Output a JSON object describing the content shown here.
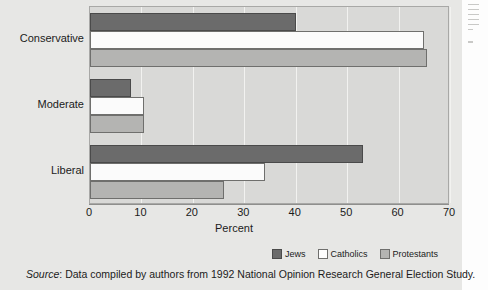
{
  "chart_data": {
    "type": "bar",
    "orientation": "horizontal",
    "title": "",
    "xlabel": "Percent",
    "ylabel": "",
    "xlim": [
      0,
      70
    ],
    "xticks": [
      0,
      10,
      20,
      30,
      40,
      50,
      60,
      70
    ],
    "grid": true,
    "legend_position": "bottom",
    "categories": [
      "Conservative",
      "Moderate",
      "Liberal"
    ],
    "series": [
      {
        "name": "Jews",
        "color": "#6b6b6b",
        "values": [
          40,
          8,
          53
        ]
      },
      {
        "name": "Catholics",
        "color": "#fbfbfb",
        "values": [
          65,
          10.5,
          34
        ]
      },
      {
        "name": "Protestants",
        "color": "#b4b4b2",
        "values": [
          65.5,
          10.5,
          26
        ]
      }
    ]
  },
  "axis": {
    "tick_labels": [
      "0",
      "10",
      "20",
      "30",
      "40",
      "50",
      "60",
      "70"
    ],
    "title": "Percent"
  },
  "legend": {
    "items": [
      {
        "label": "Jews"
      },
      {
        "label": "Catholics"
      },
      {
        "label": "Protestants"
      }
    ]
  },
  "source": {
    "prefix": "Source",
    "separator": ": ",
    "text": "Data compiled by authors from 1992 National Opinion Research General Election Study."
  }
}
